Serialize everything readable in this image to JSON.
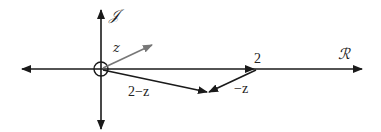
{
  "diagram": {
    "colors": {
      "axis": "#1a1a1a",
      "vector_z": "#777777",
      "vector_2_minus_z": "#1a1a1a",
      "vector_minus_z": "#1a1a1a",
      "text": "#222222"
    },
    "axes": {
      "real_label": "ℛ",
      "imag_label": "𝒥"
    },
    "labels": {
      "z": "z",
      "two_minus_z": "2−z",
      "two": "2",
      "minus_z": "−z"
    }
  }
}
